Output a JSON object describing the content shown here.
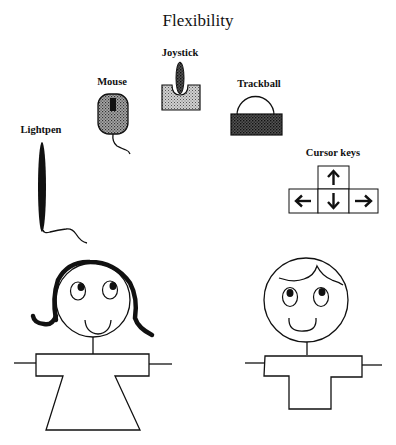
{
  "title": "Flexibility",
  "devices": [
    {
      "id": "lightpen",
      "label": "Lightpen",
      "icon": "lightpen-icon"
    },
    {
      "id": "mouse",
      "label": "Mouse",
      "icon": "mouse-icon"
    },
    {
      "id": "joystick",
      "label": "Joystick",
      "icon": "joystick-icon"
    },
    {
      "id": "trackball",
      "label": "Trackball",
      "icon": "trackball-icon"
    },
    {
      "id": "cursor_keys",
      "label": "Cursor keys",
      "icon": "cursor-keys-icon",
      "keys": [
        {
          "name": "up",
          "glyph": "↑"
        },
        {
          "name": "left",
          "glyph": "←"
        },
        {
          "name": "down",
          "glyph": "↓"
        },
        {
          "name": "right",
          "glyph": "→"
        }
      ]
    }
  ],
  "figures": [
    {
      "id": "girl",
      "description": "smiling girl stick figure with dress"
    },
    {
      "id": "boy",
      "description": "smiling boy stick figure with T-shirt"
    }
  ],
  "colors": {
    "ink": "#111111",
    "light_fill": "#b8b8b8",
    "mid_fill": "#8f8f8f",
    "dark_fill": "#3a3a3a"
  }
}
